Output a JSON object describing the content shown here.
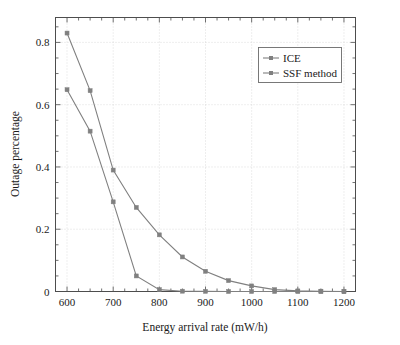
{
  "chart_data": {
    "type": "line",
    "title": "",
    "xlabel": "Energy arrival rate (mW/h)",
    "ylabel": "Outage percentage",
    "xlim": [
      575,
      1225
    ],
    "ylim": [
      0,
      0.88
    ],
    "grid": true,
    "legend_position": "top-right",
    "x": [
      600,
      650,
      700,
      750,
      800,
      850,
      900,
      950,
      1000,
      1050,
      1100,
      1150,
      1200
    ],
    "xticks": [
      600,
      700,
      800,
      900,
      1000,
      1100,
      1200
    ],
    "xtick_labels": [
      "600",
      "700",
      "800",
      "900",
      "1000",
      "1100",
      "1200"
    ],
    "yticks": [
      0,
      0.2,
      0.4,
      0.6,
      0.8
    ],
    "ytick_labels": [
      "0",
      "0.2",
      "0.4",
      "0.6",
      "0.8"
    ],
    "series": [
      {
        "name": "ICE",
        "color": "#808080",
        "marker": "square",
        "values": [
          0.83,
          0.645,
          0.39,
          0.27,
          0.182,
          0.111,
          0.065,
          0.035,
          0.018,
          0.006,
          0.002,
          0.001,
          0.0
        ]
      },
      {
        "name": "SSF method",
        "color": "#808080",
        "marker": "square",
        "values": [
          0.648,
          0.515,
          0.288,
          0.05,
          0.006,
          0.001,
          0.0005,
          0.0,
          0.0,
          0.0,
          0.0,
          0.0,
          0.0
        ]
      }
    ]
  },
  "legend": {
    "entries": [
      "ICE",
      "SSF method"
    ]
  }
}
